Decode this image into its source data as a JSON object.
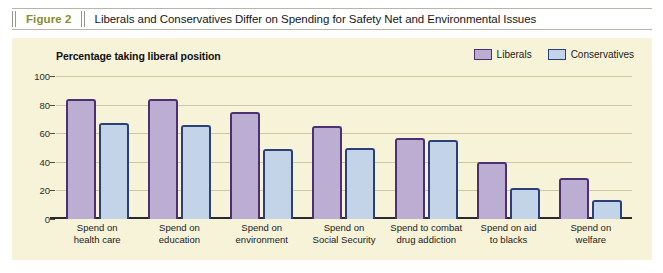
{
  "figure": {
    "number_label": "Figure 2",
    "title": "Liberals and Conservatives Differ on Spending for Safety Net and Environmental Issues"
  },
  "colors": {
    "panel_background": "#f7f3d8",
    "liberal_fill": "#bcaed2",
    "liberal_border": "#4d2f72",
    "conservative_fill": "#c4d4e8",
    "conservative_border": "#2b3f7a",
    "gridline": "#cdc89f",
    "figure_number_text": "#8a8b2e"
  },
  "chart_data": {
    "type": "bar",
    "title": "Liberals and Conservatives Differ on Spending for Safety Net and Environmental Issues",
    "subtitle": "Percentage taking liberal position",
    "xlabel": "",
    "ylabel": "",
    "ylim": [
      0,
      100
    ],
    "yticks": [
      0,
      20,
      40,
      60,
      80,
      100
    ],
    "ytick_labels": [
      "0",
      "20",
      "40",
      "60",
      "80",
      "100"
    ],
    "grid": true,
    "legend_position": "top-right",
    "categories": [
      "Spend on health care",
      "Spend on education",
      "Spend on environment",
      "Spend on Social Security",
      "Spend to combat drug addiction",
      "Spend on aid to blacks",
      "Spend on welfare"
    ],
    "category_lines": [
      [
        "Spend on",
        "health care"
      ],
      [
        "Spend on",
        "education"
      ],
      [
        "Spend on",
        "environment"
      ],
      [
        "Spend on",
        "Social Security"
      ],
      [
        "Spend to combat",
        "drug addiction"
      ],
      [
        "Spend on aid",
        "to blacks"
      ],
      [
        "Spend on",
        "welfare"
      ]
    ],
    "series": [
      {
        "name": "Liberals",
        "values": [
          84,
          84,
          75,
          65,
          57,
          40,
          29
        ]
      },
      {
        "name": "Conservatives",
        "values": [
          67,
          66,
          49,
          50,
          55,
          22,
          13
        ]
      }
    ]
  }
}
